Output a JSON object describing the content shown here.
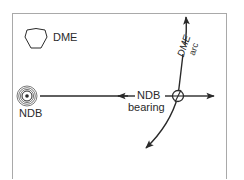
{
  "diagram": {
    "colors": {
      "line": "#2a2a2a",
      "frame": "#a9a9a9",
      "background": "#ffffff"
    },
    "stations": {
      "dme": {
        "label": "DME",
        "symbol": "dme-hexagon-icon"
      },
      "ndb": {
        "label": "NDB",
        "symbol": "ndb-concentric-circles-icon"
      }
    },
    "bearing": {
      "label_line1": "NDB",
      "label_line2": "bearing"
    },
    "arc": {
      "label_line1": "DME",
      "label_line2": "arc"
    },
    "fix": {
      "symbol": "fix-circle-icon"
    }
  }
}
